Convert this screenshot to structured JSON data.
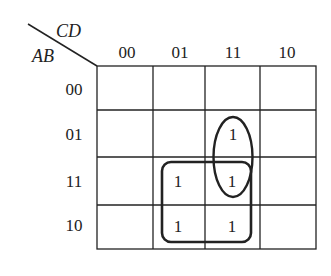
{
  "kmap": {
    "col_variables": "CD",
    "row_variables": "AB",
    "col_labels": [
      "00",
      "01",
      "11",
      "10"
    ],
    "row_labels": [
      "00",
      "01",
      "11",
      "10"
    ],
    "cells": [
      [
        "",
        "",
        "",
        ""
      ],
      [
        "",
        "",
        "1",
        ""
      ],
      [
        "",
        "1",
        "1",
        ""
      ],
      [
        "",
        "1",
        "1",
        ""
      ]
    ],
    "groups": [
      {
        "shape": "ellipse",
        "covers": "AB=01,11; CD=11"
      },
      {
        "shape": "rounded-rect",
        "covers": "AB=11,10; CD=01,11"
      }
    ],
    "colors": {
      "line": "#222222",
      "background": "#ffffff"
    }
  }
}
